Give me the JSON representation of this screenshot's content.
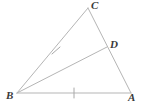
{
  "figure": {
    "background_color": "#ffffff",
    "stroke_color": "#b5b5b5",
    "tick_color": "#a8a8a8",
    "label_color": "#3a3a3a",
    "stroke_width": 1,
    "width": 144,
    "height": 106
  },
  "points": {
    "A": {
      "label": "A",
      "x": 131,
      "y": 93
    },
    "B": {
      "label": "B",
      "x": 17,
      "y": 93
    },
    "C": {
      "label": "C",
      "x": 88,
      "y": 8
    },
    "D": {
      "label": "D",
      "x": 107,
      "y": 47
    }
  },
  "segments": [
    {
      "name": "segment-BC",
      "from": "B",
      "to": "C",
      "x1": 17,
      "y1": 93,
      "x2": 88,
      "y2": 8
    },
    {
      "name": "segment-CA",
      "from": "C",
      "to": "A",
      "x1": 88,
      "y1": 8,
      "x2": 131,
      "y2": 93
    },
    {
      "name": "segment-BA",
      "from": "B",
      "to": "A",
      "x1": 17,
      "y1": 93,
      "x2": 131,
      "y2": 93
    },
    {
      "name": "segment-BD",
      "from": "B",
      "to": "D",
      "x1": 17,
      "y1": 93,
      "x2": 107,
      "y2": 47
    }
  ],
  "tick_marks": [
    {
      "name": "tick-on-BC",
      "on_segment": "segment-BC",
      "count": 1,
      "x1": 52,
      "y1": 54,
      "x2": 60,
      "y2": 47
    },
    {
      "name": "tick-on-BA",
      "on_segment": "segment-BA",
      "count": 1,
      "x1": 74,
      "y1": 88,
      "x2": 74,
      "y2": 98
    }
  ],
  "labels": {
    "A": "A",
    "B": "B",
    "C": "C",
    "D": "D"
  }
}
